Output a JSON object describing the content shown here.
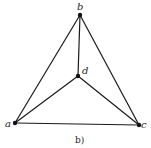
{
  "diagram": {
    "caption": "b)",
    "nodes": [
      {
        "id": "a",
        "label": "a",
        "x": 15,
        "y": 123
      },
      {
        "id": "b",
        "label": "b",
        "x": 80,
        "y": 15
      },
      {
        "id": "c",
        "label": "c",
        "x": 139,
        "y": 125
      },
      {
        "id": "d",
        "label": "d",
        "x": 78,
        "y": 76
      }
    ],
    "edges": [
      [
        "a",
        "b"
      ],
      [
        "b",
        "c"
      ],
      [
        "a",
        "c"
      ],
      [
        "a",
        "d"
      ],
      [
        "b",
        "d"
      ],
      [
        "c",
        "d"
      ]
    ],
    "colors": {
      "stroke": "#1a1a1a",
      "node": "#111111"
    }
  }
}
